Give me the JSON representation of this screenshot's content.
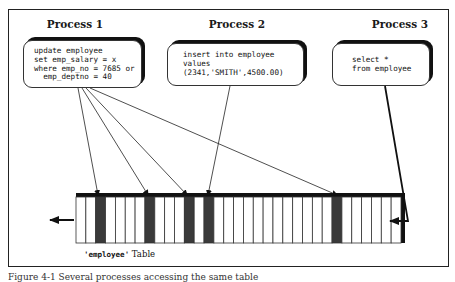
{
  "processes": [
    {
      "label": "Process 1",
      "sql": "update employee\nset emp_salary = x\nwhere emp_no = 7685 or\n  emp_deptno = 40"
    },
    {
      "label": "Process 2",
      "sql": "insert into employee\nvalues\n(2341,'SMITH',4500.00)"
    },
    {
      "label": "Process 3",
      "sql": "select *\nfrom employee"
    }
  ],
  "table": {
    "name_quoted": "'employee'",
    "suffix": " Table",
    "cell_count": 33,
    "highlighted_cells": [
      2,
      7,
      11,
      13,
      26
    ],
    "colors": {
      "highlight": "#3a3a3a",
      "border": "#222222",
      "bar": "#111111"
    }
  },
  "arrows": {
    "process1_targets": [
      "row-2",
      "row-7",
      "row-11",
      "row-26"
    ],
    "process2_targets": [
      "row-13"
    ],
    "process3_scan_direction": "right-to-left"
  },
  "caption": "Figure 4-1 Several processes accessing the same table"
}
